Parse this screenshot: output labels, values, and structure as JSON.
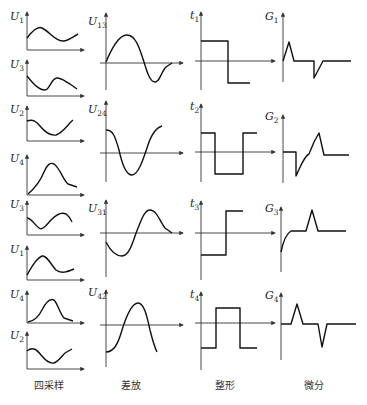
{
  "columns": [
    {
      "key": "sampling",
      "caption": "四采样"
    },
    {
      "key": "diff_amp",
      "caption": "差放"
    },
    {
      "key": "shaping",
      "caption": "整形"
    },
    {
      "key": "differentiate",
      "caption": "微分"
    }
  ],
  "sampling_plots": [
    {
      "label": "U",
      "sub": "1"
    },
    {
      "label": "U",
      "sub": "3"
    },
    {
      "label": "U",
      "sub": "2"
    },
    {
      "label": "U",
      "sub": "4"
    },
    {
      "label": "U",
      "sub": "3"
    },
    {
      "label": "U",
      "sub": "1"
    },
    {
      "label": "U",
      "sub": "4"
    },
    {
      "label": "U",
      "sub": "2"
    }
  ],
  "diff_plots": [
    {
      "label": "U",
      "sub": "13"
    },
    {
      "label": "U",
      "sub": "24"
    },
    {
      "label": "U",
      "sub": "31"
    },
    {
      "label": "U",
      "sub": "42"
    }
  ],
  "shaping_plots": [
    {
      "label": "t",
      "sub": "1"
    },
    {
      "label": "t",
      "sub": "2"
    },
    {
      "label": "t",
      "sub": "3"
    },
    {
      "label": "t",
      "sub": "4"
    }
  ],
  "differentiate_plots": [
    {
      "label": "G",
      "sub": "1"
    },
    {
      "label": "G",
      "sub": "2"
    },
    {
      "label": "G",
      "sub": "3"
    },
    {
      "label": "G",
      "sub": "4"
    }
  ]
}
